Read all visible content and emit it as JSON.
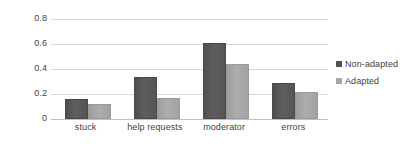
{
  "chart_data": {
    "type": "bar",
    "title": "",
    "xlabel": "",
    "ylabel": "",
    "categories": [
      "stuck",
      "help requests",
      "moderator",
      "errors"
    ],
    "series": [
      {
        "name": "Non-adapted",
        "color": "#555555",
        "values": [
          0.16,
          0.34,
          0.61,
          0.29
        ]
      },
      {
        "name": "Adapted",
        "color": "#a6a6a6",
        "values": [
          0.12,
          0.17,
          0.44,
          0.22
        ]
      }
    ],
    "ylim": [
      0,
      0.8
    ],
    "ytick_step": 0.2,
    "ytick_labels": [
      "0.8",
      "0.6",
      "0.4",
      "0.2",
      "0"
    ],
    "ytick_values": [
      0.8,
      0.6,
      0.4,
      0.2,
      0
    ],
    "grid": true,
    "grid_axis": "y",
    "legend_position": "right",
    "gridline_color": "#d9d9d9",
    "axis_color": "#bfbfbf",
    "background_color": "#ffffff",
    "text_color": "#3f3f3f"
  }
}
